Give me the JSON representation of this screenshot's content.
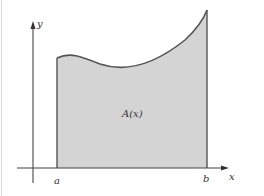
{
  "diagram": {
    "type": "area-under-curve",
    "labels": {
      "y_axis": "y",
      "x_axis": "x",
      "left_bound": "a",
      "right_bound": "b",
      "region": "A(x)"
    },
    "colors": {
      "region_fill": "#d4d4d4",
      "curve_stroke": "#555555",
      "axis_stroke": "#444444",
      "label_color": "#333333",
      "background": "#ffffff"
    }
  }
}
